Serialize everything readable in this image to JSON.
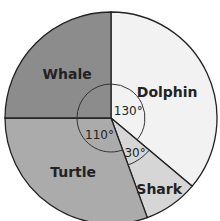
{
  "chart_data": {
    "type": "pie",
    "title": "",
    "unit": "degrees",
    "categories": [
      "Dolphin",
      "Shark",
      "Turtle",
      "Whale"
    ],
    "values": [
      130,
      30,
      110,
      90
    ],
    "slices": [
      {
        "label": "Dolphin",
        "angle": 130,
        "angle_label": "130°",
        "color": "#f2f2f2"
      },
      {
        "label": "Shark",
        "angle": 30,
        "angle_label": "30°",
        "color": "#d6d6d6"
      },
      {
        "label": "Turtle",
        "angle": 110,
        "angle_label": "110°",
        "color": "#ababab"
      },
      {
        "label": "Whale",
        "angle": 90,
        "angle_label": "",
        "color": "#8c8c8c"
      }
    ]
  }
}
